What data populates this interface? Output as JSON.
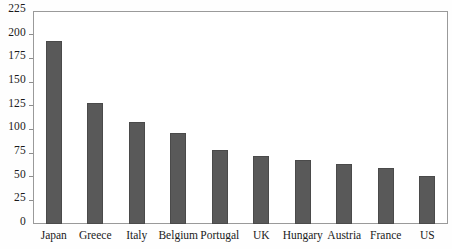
{
  "chart_data": {
    "type": "bar",
    "title": "",
    "subtitle": "",
    "xlabel": "",
    "ylabel": "",
    "categories": [
      "Japan",
      "Greece",
      "Italy",
      "Belgium",
      "Portugal",
      "UK",
      "Hungary",
      "Austria",
      "France",
      "US"
    ],
    "values": [
      193,
      128,
      108,
      96,
      78,
      72,
      68,
      63,
      59,
      51
    ],
    "ylim": [
      0,
      225
    ],
    "yticks": [
      0,
      25,
      50,
      75,
      100,
      125,
      150,
      175,
      200,
      225
    ],
    "ytick_labels": [
      "0",
      "25",
      "50",
      "75",
      "100",
      "125",
      "150",
      "175",
      "200",
      "225"
    ],
    "grid": false,
    "legend": null,
    "legend_position": "none",
    "bar_color": "#595959",
    "bar_edge_color": "#4a4a4a",
    "axis_color": "#9a9a9a",
    "background_color": "#ffffff",
    "text_color": "#1a1a1a",
    "annotations": []
  },
  "axes": {
    "y_axis_name": "y-axis",
    "x_axis_name": "x-axis"
  }
}
